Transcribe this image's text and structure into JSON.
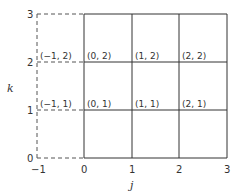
{
  "diagram": {
    "type": "grid-lattice",
    "axes": {
      "x": {
        "label": "j",
        "ticks": [
          "−1",
          "0",
          "1",
          "2",
          "3"
        ]
      },
      "y": {
        "label": "k",
        "ticks": [
          "0",
          "1",
          "2",
          "3"
        ]
      }
    },
    "solid_region": {
      "j_range": [
        0,
        3
      ],
      "k_range": [
        0,
        3
      ]
    },
    "dashed_region": {
      "j_range": [
        -1,
        0
      ],
      "k_range": [
        0,
        3
      ]
    },
    "points": [
      {
        "label": "(−1, 2)"
      },
      {
        "label": "(0, 2)"
      },
      {
        "label": "(1, 2)"
      },
      {
        "label": "(2, 2)"
      },
      {
        "label": "(−1, 1)"
      },
      {
        "label": "(0, 1)"
      },
      {
        "label": "(1, 1)"
      },
      {
        "label": "(2, 1)"
      }
    ]
  }
}
